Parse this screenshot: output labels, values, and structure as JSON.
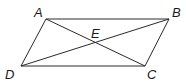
{
  "diagram": {
    "type": "parallelogram with diagonals",
    "points": {
      "A": {
        "label": "A",
        "x": 46,
        "y": 19,
        "label_x": 34,
        "label_y": 17
      },
      "B": {
        "label": "B",
        "x": 169,
        "y": 19,
        "label_x": 172,
        "label_y": 17
      },
      "C": {
        "label": "C",
        "x": 145,
        "y": 66,
        "label_x": 147,
        "label_y": 79
      },
      "D": {
        "label": "D",
        "x": 21,
        "y": 66,
        "label_x": 5,
        "label_y": 79
      },
      "E": {
        "label": "E",
        "x": 95,
        "y": 41,
        "label_x": 91,
        "label_y": 38
      }
    },
    "segments": [
      [
        "A",
        "B"
      ],
      [
        "B",
        "C"
      ],
      [
        "C",
        "D"
      ],
      [
        "D",
        "A"
      ],
      [
        "A",
        "C"
      ],
      [
        "B",
        "D"
      ]
    ],
    "colors": {
      "line": "#2a2a2a",
      "text": "#1a1a1a",
      "background": "#ffffff"
    }
  }
}
